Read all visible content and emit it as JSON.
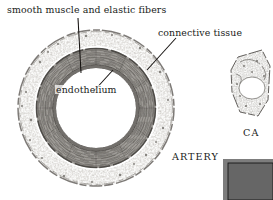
{
  "figure": {
    "background_color": "#ffffff",
    "ink_color": "#201c19",
    "tissue_color": "#808080"
  },
  "labels": {
    "smooth_muscle": "smooth muscle and elastic fibers",
    "connective_tissue": "connective tissue",
    "endothelium": "endothelium",
    "artery": "ARTERY",
    "capillary": "CA"
  },
  "specimens": [
    {
      "name": "artery",
      "caption": "ARTERY"
    },
    {
      "name": "capillary",
      "caption": "CA"
    },
    {
      "name": "micrograph-inset",
      "caption": ""
    }
  ],
  "structures": [
    "connective tissue",
    "smooth muscle and elastic fibers",
    "endothelium",
    "lumen"
  ]
}
